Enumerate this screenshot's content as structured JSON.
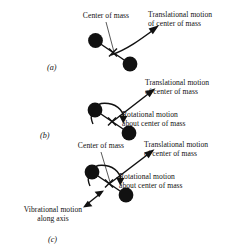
{
  "figure": {
    "caption_tags": [
      "(a)",
      "(b)",
      "(c)"
    ],
    "panels": [
      {
        "tag": "(a)",
        "labels": {
          "center_of_mass": "Center of mass",
          "translational_line1": "Translational motion",
          "translational_line2": "of center of mass"
        },
        "motions": [
          "translational"
        ]
      },
      {
        "tag": "(b)",
        "labels": {
          "translational_line1": "Translational motion",
          "translational_line2": "of center of mass",
          "rotational_line1": "Rotational motion",
          "rotational_line2": "about center of mass"
        },
        "motions": [
          "translational",
          "rotational"
        ]
      },
      {
        "tag": "(c)",
        "labels": {
          "center_of_mass": "Center of mass",
          "translational_line1": "Translational motion",
          "translational_line2": "of center of mass",
          "rotational_line1": "Rotational motion",
          "rotational_line2": "about center of mass",
          "vibrational_line1": "Vibrational motion",
          "vibrational_line2": "along axis"
        },
        "motions": [
          "translational",
          "rotational",
          "vibrational"
        ]
      }
    ]
  },
  "colors": {
    "ink": "#000000",
    "atom_fill": "#111111",
    "background": "#ffffff"
  }
}
